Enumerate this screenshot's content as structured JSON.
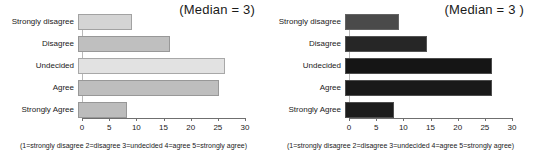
{
  "figure": {
    "background": "#ffffff",
    "panel_count": 2
  },
  "panels": [
    {
      "name": "left-chart",
      "median_label": "(Median = 3)",
      "footnote": "(1=strongly disagree 2=disagree 3=undecided 4=agree 5=strongly agree)",
      "chart_data": {
        "type": "bar",
        "orientation": "horizontal",
        "title": "",
        "subtitle": "",
        "xlabel": "",
        "ylabel": "",
        "categories": [
          "Strongly disagree",
          "Disagree",
          "Undecided",
          "Agree",
          "Strongly Agree"
        ],
        "values": [
          10,
          17,
          27,
          26,
          9
        ],
        "bar_colors": [
          "#d4d4d4",
          "#bfbfbf",
          "#e2e2e2",
          "#bebebe",
          "#bcbcbc"
        ],
        "xlim": [
          0,
          30
        ],
        "xticks": [
          0,
          5,
          10,
          15,
          20,
          25,
          30
        ],
        "xticklabels": [
          "0",
          "5",
          "10",
          "15",
          "20",
          "25",
          "30"
        ],
        "grid": false,
        "legend": false,
        "annotations": [
          "(Median = 3)"
        ]
      }
    },
    {
      "name": "right-chart",
      "median_label": "(Median = 3 )",
      "footnote": "(1=strongly disagree 2=disagree 3=undecided 4=agree 5=strongly agree)",
      "chart_data": {
        "type": "bar",
        "orientation": "horizontal",
        "title": "",
        "subtitle": "",
        "xlabel": "",
        "ylabel": "",
        "categories": [
          "Strongly disagree",
          "Disagree",
          "Undecided",
          "Agree",
          "Strongly Agree"
        ],
        "values": [
          10,
          15,
          27,
          27,
          9
        ],
        "bar_colors": [
          "#4a4a4a",
          "#262626",
          "#151515",
          "#191919",
          "#1c1c1c"
        ],
        "xlim": [
          0,
          30
        ],
        "xticks": [
          0,
          5,
          10,
          15,
          20,
          25,
          30
        ],
        "xticklabels": [
          "0",
          "5",
          "10",
          "15",
          "20",
          "25",
          "30"
        ],
        "grid": false,
        "legend": false,
        "annotations": [
          "(Median = 3 )"
        ]
      }
    }
  ]
}
